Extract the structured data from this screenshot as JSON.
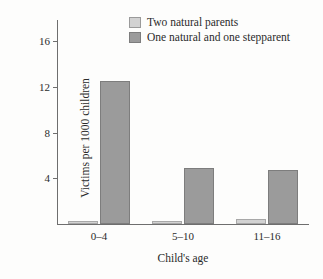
{
  "chart_data": {
    "type": "bar",
    "title": "",
    "xlabel": "Child's age",
    "ylabel": "Victims per 1000 children",
    "categories": [
      "0–4",
      "5–10",
      "11–16"
    ],
    "series": [
      {
        "name": "Two natural parents",
        "values": [
          0.25,
          0.2,
          0.45
        ],
        "color": "#d2d2d2"
      },
      {
        "name": "One natural and one stepparent",
        "values": [
          12.5,
          4.9,
          4.7
        ],
        "color": "#9b9b9b"
      }
    ],
    "ylim": [
      0,
      17
    ],
    "yticks": [
      4,
      8,
      12,
      16
    ],
    "ytick_labels": [
      "4",
      "8",
      "12",
      "16"
    ],
    "grid": false,
    "legend_position": "top-center"
  },
  "axes": {
    "y_title": "Victims per 1000 children",
    "x_title": "Child's age",
    "y_ticks": [
      {
        "label": "16",
        "value": 16
      },
      {
        "label": "12",
        "value": 12
      },
      {
        "label": "8",
        "value": 8
      },
      {
        "label": "4",
        "value": 4
      }
    ],
    "x_groups": [
      {
        "label": "0–4"
      },
      {
        "label": "5–10"
      },
      {
        "label": "11–16"
      }
    ]
  },
  "legend": {
    "items": [
      {
        "label": "Two natural parents",
        "swatch": "light"
      },
      {
        "label": "One natural and one stepparent",
        "swatch": "dark"
      }
    ]
  },
  "colors": {
    "light_bar": "#d2d2d2",
    "dark_bar": "#9b9b9b",
    "axis": "#6e6e6e",
    "text": "#2b2b2b",
    "background": "#fdfdfc"
  }
}
